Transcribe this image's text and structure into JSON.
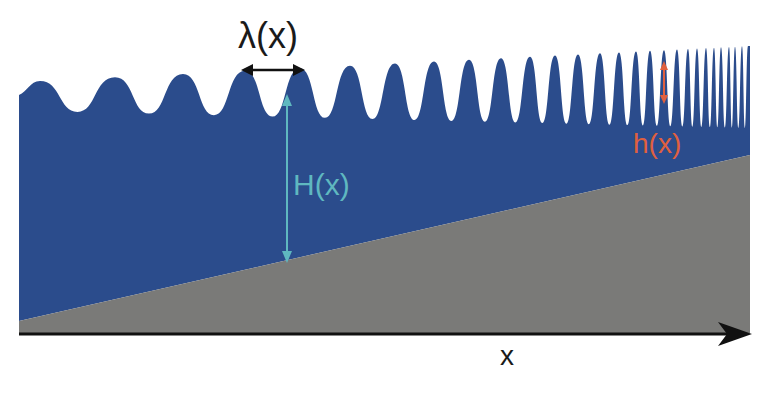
{
  "diagram": {
    "labels": {
      "wavelength": "λ(x)",
      "depth": "H(x)",
      "amplitude": "h(x)",
      "axis": "x"
    },
    "colors": {
      "water": "#2b4c8c",
      "bed": "#7a7a78",
      "axis": "#111111",
      "depth_arrow": "#5fb8c0",
      "amplitude_arrow": "#e0603e",
      "wavelength_arrow": "#111111"
    },
    "geometry": {
      "left_x": 19,
      "right_x": 750,
      "bed_left_y": 321,
      "bed_right_y": 155,
      "axis_y": 334,
      "wave_peaks_x": [
        40,
        115,
        183,
        245,
        300,
        350,
        395,
        434,
        469,
        501,
        530,
        555,
        578,
        600,
        619,
        636,
        650,
        664,
        677,
        688,
        697,
        706,
        714,
        721,
        729,
        735,
        742,
        748
      ]
    }
  }
}
